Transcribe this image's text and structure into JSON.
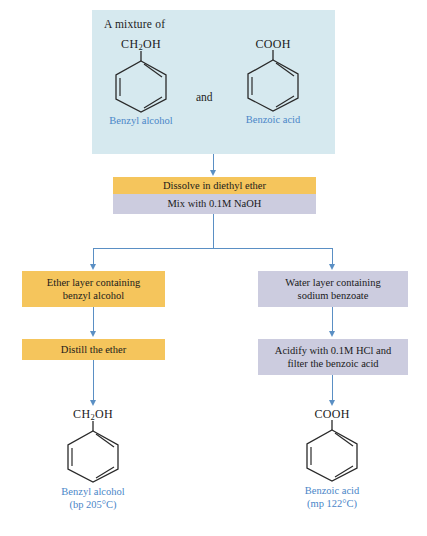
{
  "diagram": {
    "colors": {
      "panel_blue": "#d6e9ef",
      "box_orange": "#f5c55c",
      "box_lavender": "#ccccdf",
      "arrow_blue": "#5a8fc4",
      "label_blue": "#4a86c8",
      "text_black": "#1a1a1a"
    }
  },
  "mixture": {
    "caption": "A mixture of",
    "conjunction": "and",
    "left_compound": {
      "formula_head": "CH",
      "formula_sub": "2",
      "formula_tail": "OH",
      "name": "Benzyl alcohol"
    },
    "right_compound": {
      "formula": "COOH",
      "name": "Benzoic acid"
    }
  },
  "steps": {
    "dissolve": "Dissolve in diethyl ether",
    "mix": "Mix with 0.1M NaOH",
    "ether_layer_line1": "Ether layer containing",
    "ether_layer_line2": "benzyl alcohol",
    "water_layer_line1": "Water layer containing",
    "water_layer_line2": "sodium benzoate",
    "distill": "Distill the ether",
    "acidify_line1": "Acidify with 0.1M HCl and",
    "acidify_line2": "filter the benzoic acid"
  },
  "products": {
    "left": {
      "formula_head": "CH",
      "formula_sub": "2",
      "formula_tail": "OH",
      "name": "Benzyl alcohol",
      "property": "(bp 205°C)"
    },
    "right": {
      "formula": "COOH",
      "name": "Benzoic acid",
      "property": "(mp 122°C)"
    }
  }
}
